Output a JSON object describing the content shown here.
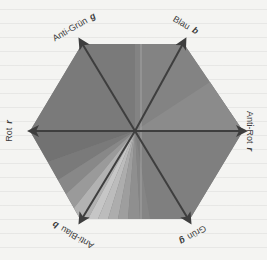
{
  "diagram": {
    "type": "color-opponent-hexagon",
    "center": [
      135,
      131
    ],
    "axes": [
      {
        "id": "rot",
        "label": "Rot",
        "symbol": "r",
        "direction": "left",
        "tip": [
          30,
          131
        ]
      },
      {
        "id": "anti-rot",
        "label": "Anti-Rot",
        "symbol": "r",
        "direction": "right",
        "tip": [
          245,
          131
        ]
      },
      {
        "id": "anti-gruen",
        "label": "Anti-Grün",
        "symbol": "g",
        "direction": "upper-left",
        "tip": [
          80,
          40
        ]
      },
      {
        "id": "gruen",
        "label": "Grün",
        "symbol": "g",
        "direction": "lower-right",
        "tip": [
          190,
          222
        ]
      },
      {
        "id": "blau",
        "label": "Blau",
        "symbol": "b",
        "direction": "upper-right",
        "tip": [
          185,
          40
        ]
      },
      {
        "id": "anti-blau",
        "label": "Anti-Blau",
        "symbol": "b",
        "direction": "lower-left",
        "tip": [
          80,
          222
        ]
      }
    ],
    "hexagon_vertices": [
      [
        82,
        44
      ],
      [
        184,
        44
      ],
      [
        243,
        131
      ],
      [
        190,
        219
      ],
      [
        80,
        219
      ],
      [
        30,
        131
      ]
    ],
    "colors": {
      "background": "#f4f4f2",
      "hex_base": "#7e7e7e",
      "hex_upper": "#858585",
      "hex_right": "#8a8a8a",
      "arrow": "#3e3e3e",
      "label_text": "#3a3a3a",
      "fan_dark": "#6e6e6e",
      "fan_light": "#c8c8c8",
      "fan_mid": "#a4a4a4"
    }
  }
}
